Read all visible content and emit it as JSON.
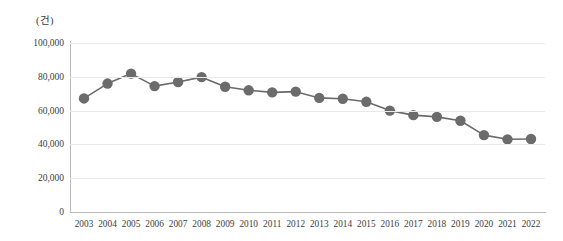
{
  "chart_data": {
    "type": "line",
    "title": "",
    "subtitle": "",
    "xlabel": "",
    "ylabel": "",
    "unit_label": "(건)",
    "grid": true,
    "legend": "none",
    "xlim": [
      2003,
      2022
    ],
    "ylim": [
      0,
      100000
    ],
    "yticks": [
      0,
      20000,
      40000,
      60000,
      80000,
      100000
    ],
    "ytick_labels": [
      "0",
      "20,000",
      "40,000",
      "60,000",
      "80,000",
      "100,000"
    ],
    "categories": [
      2003,
      2004,
      2005,
      2006,
      2007,
      2008,
      2009,
      2010,
      2011,
      2012,
      2013,
      2014,
      2015,
      2016,
      2017,
      2018,
      2019,
      2020,
      2021,
      2022
    ],
    "xtick_labels": [
      "2003",
      "2004",
      "2005",
      "2006",
      "2007",
      "2008",
      "2009",
      "2010",
      "2011",
      "2012",
      "2013",
      "2014",
      "2015",
      "2016",
      "2017",
      "2018",
      "2019",
      "2020",
      "2021",
      "2022"
    ],
    "values": [
      67200,
      76000,
      81900,
      74500,
      76900,
      79800,
      74100,
      72000,
      70800,
      71200,
      67500,
      67000,
      65200,
      60000,
      57300,
      56300,
      54000,
      45500,
      43000,
      43200
    ],
    "series": [
      {
        "name": "건수",
        "values": [
          67200,
          76000,
          81900,
          74500,
          76900,
          79800,
          74100,
          72000,
          70800,
          71200,
          67500,
          67000,
          65200,
          60000,
          57300,
          56300,
          54000,
          45500,
          43000,
          43200
        ]
      }
    ],
    "colors": {
      "line": "#6b6b6b",
      "marker": "#6b6b6b",
      "grid": "#e9e9e9",
      "axis": "#b9b9b9",
      "text": "#3c3c3c",
      "background": "#ffffff"
    },
    "marker_size": 5.2,
    "line_width": 1.6
  }
}
